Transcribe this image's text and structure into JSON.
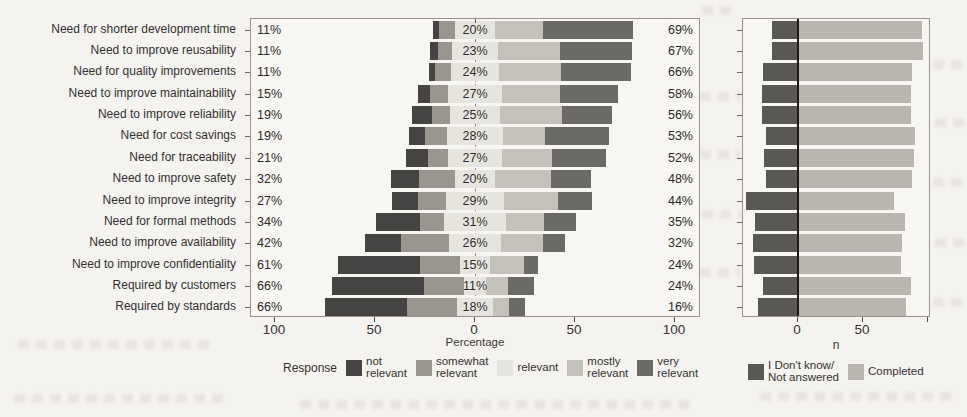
{
  "chart_data": [
    {
      "type": "bar",
      "subtype": "diverging-stacked-likert",
      "title": "",
      "xlabel": "Percentage",
      "x_ticks": [
        "100",
        "50",
        "0",
        "50",
        "100"
      ],
      "x_tick_units": [
        -100,
        -50,
        0,
        50,
        100
      ],
      "xlim": [
        -112,
        113
      ],
      "grid": false,
      "legend_position": "bottom",
      "legend_title": "Response",
      "legend": [
        "not relevant",
        "somewhat relevant",
        "relevant",
        "mostly relevant",
        "very relevant"
      ],
      "legend_two_line": [
        [
          "not",
          "relevant"
        ],
        [
          "somewhat",
          "relevant"
        ],
        [
          "relevant"
        ],
        [
          "mostly",
          "relevant"
        ],
        [
          "very",
          "relevant"
        ]
      ],
      "legend_colors": [
        "#454442",
        "#98968f",
        "#e6e4de",
        "#c3c1ba",
        "#6b6a66"
      ],
      "rows": [
        {
          "category": "Need for shorter development time",
          "left_pct": "11%",
          "mid_pct": "20%",
          "right_pct": "69%",
          "values": [
            3,
            8,
            20,
            24,
            45
          ]
        },
        {
          "category": "Need to improve reusability",
          "left_pct": "11%",
          "mid_pct": "23%",
          "right_pct": "67%",
          "values": [
            4,
            7,
            23,
            31,
            36
          ]
        },
        {
          "category": "Need for quality improvements",
          "left_pct": "11%",
          "mid_pct": "24%",
          "right_pct": "66%",
          "values": [
            3,
            8,
            24,
            31,
            35
          ]
        },
        {
          "category": "Need to improve maintainability",
          "left_pct": "15%",
          "mid_pct": "27%",
          "right_pct": "58%",
          "values": [
            6,
            9,
            27,
            29,
            29
          ]
        },
        {
          "category": "Need to improve reliability",
          "left_pct": "19%",
          "mid_pct": "25%",
          "right_pct": "56%",
          "values": [
            10,
            9,
            25,
            31,
            25
          ]
        },
        {
          "category": "Need for cost savings",
          "left_pct": "19%",
          "mid_pct": "28%",
          "right_pct": "53%",
          "values": [
            8,
            11,
            28,
            21,
            32
          ]
        },
        {
          "category": "Need for traceability",
          "left_pct": "21%",
          "mid_pct": "27%",
          "right_pct": "52%",
          "values": [
            11,
            10,
            27,
            25,
            27
          ]
        },
        {
          "category": "Need to improve safety",
          "left_pct": "32%",
          "mid_pct": "20%",
          "right_pct": "48%",
          "values": [
            14,
            18,
            20,
            28,
            20
          ]
        },
        {
          "category": "Need to improve integrity",
          "left_pct": "27%",
          "mid_pct": "29%",
          "right_pct": "44%",
          "values": [
            13,
            14,
            29,
            27,
            17
          ]
        },
        {
          "category": "Need for formal methods",
          "left_pct": "34%",
          "mid_pct": "31%",
          "right_pct": "35%",
          "values": [
            22,
            12,
            31,
            19,
            16
          ]
        },
        {
          "category": "Need to improve availability",
          "left_pct": "42%",
          "mid_pct": "26%",
          "right_pct": "32%",
          "values": [
            18,
            24,
            26,
            21,
            11
          ]
        },
        {
          "category": "Need to improve confidentiality",
          "left_pct": "61%",
          "mid_pct": "15%",
          "right_pct": "24%",
          "values": [
            41,
            20,
            15,
            17,
            7
          ]
        },
        {
          "category": "Required by customers",
          "left_pct": "66%",
          "mid_pct": "11%",
          "right_pct": "24%",
          "values": [
            46,
            20,
            11,
            11,
            13
          ]
        },
        {
          "category": "Required by standards",
          "left_pct": "66%",
          "mid_pct": "18%",
          "right_pct": "16%",
          "values": [
            41,
            25,
            18,
            8,
            8
          ]
        }
      ]
    },
    {
      "type": "bar",
      "subtype": "stacked-counts",
      "title": "",
      "xlabel": "n",
      "x_ticks": [
        "0",
        "50"
      ],
      "x_tick_units": [
        0,
        50
      ],
      "x_minor_tick_units": [
        100
      ],
      "xlim": [
        -42,
        102
      ],
      "grid": false,
      "legend_position": "bottom",
      "legend": [
        "I Don't know/Not answered",
        "Completed"
      ],
      "legend_two_line": [
        [
          "I Don't know/",
          "Not answered"
        ],
        [
          "Completed"
        ]
      ],
      "legend_colors": [
        "#5a5853",
        "#b8b6af"
      ],
      "rows": [
        {
          "dont_know": 20,
          "completed": 95
        },
        {
          "dont_know": 20,
          "completed": 96
        },
        {
          "dont_know": 27,
          "completed": 88
        },
        {
          "dont_know": 28,
          "completed": 87
        },
        {
          "dont_know": 28,
          "completed": 87
        },
        {
          "dont_know": 25,
          "completed": 90
        },
        {
          "dont_know": 26,
          "completed": 89
        },
        {
          "dont_know": 25,
          "completed": 88
        },
        {
          "dont_know": 40,
          "completed": 74
        },
        {
          "dont_know": 33,
          "completed": 82
        },
        {
          "dont_know": 35,
          "completed": 80
        },
        {
          "dont_know": 34,
          "completed": 79
        },
        {
          "dont_know": 27,
          "completed": 87
        },
        {
          "dont_know": 31,
          "completed": 83
        }
      ]
    }
  ]
}
